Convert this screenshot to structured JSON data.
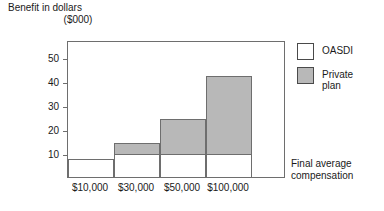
{
  "chart_data": {
    "type": "bar",
    "stacked": true,
    "title": "",
    "ylabel_line1": "Benefit in dollars",
    "ylabel_line2": "($000)",
    "xlabel_line1": "Final average",
    "xlabel_line2": "compensation",
    "categories": [
      "$10,000",
      "$30,000",
      "$50,000",
      "$100,000"
    ],
    "series": [
      {
        "name": "OASDI",
        "values": [
          8,
          10,
          10,
          10
        ],
        "color": "#ffffff"
      },
      {
        "name": "Private plan",
        "values": [
          0,
          5,
          15,
          33
        ],
        "color": "#b8b8b8"
      }
    ],
    "totals": [
      8,
      15,
      25,
      43
    ],
    "ylim": [
      0,
      57
    ],
    "yticks": [
      10,
      20,
      30,
      40,
      50
    ],
    "ytick_labels": [
      "10",
      "20",
      "30",
      "40",
      "50"
    ],
    "grid": false,
    "legend_position": "right"
  },
  "legend": {
    "items": [
      {
        "label": "OASDI",
        "color": "#ffffff"
      },
      {
        "label": "Private\nplan",
        "color": "#b8b8b8"
      }
    ]
  }
}
